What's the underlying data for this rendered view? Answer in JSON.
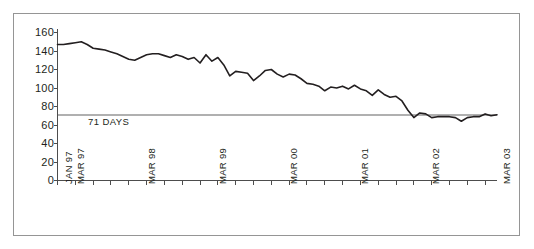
{
  "figure": {
    "background_color": "#ffffff",
    "frame_color": "#959595"
  },
  "chart_data": {
    "type": "line",
    "title": "",
    "subtitle": "",
    "xlabel": "",
    "ylabel": "",
    "ylim": [
      0,
      160
    ],
    "xlim": [
      0,
      74
    ],
    "grid": false,
    "legend": null,
    "line_color": "#231f20",
    "reference_line": {
      "label": "71 DAYS",
      "value": 71,
      "color": "#b0b0b0"
    },
    "ytick_labels": [
      "0",
      "20",
      "40",
      "60",
      "80",
      "100",
      "120",
      "140",
      "160"
    ],
    "ytick_values": [
      0,
      20,
      40,
      60,
      80,
      100,
      120,
      140,
      160
    ],
    "xtick_labels": [
      "JAN 97",
      "MAR 97",
      "MAR 98",
      "MAR 99",
      "MAR 00",
      "MAR 01",
      "MAR 02",
      "MAR 03"
    ],
    "xtick_label_positions": [
      0,
      2,
      14,
      26,
      38,
      50,
      62,
      74
    ],
    "minor_tick_interval_months": 3,
    "x_unit": "month_index_from_jan_1997",
    "x": [
      0,
      1,
      2,
      3,
      4,
      5,
      6,
      7,
      8,
      9,
      10,
      11,
      12,
      13,
      14,
      15,
      16,
      17,
      18,
      19,
      20,
      21,
      22,
      23,
      24,
      25,
      26,
      27,
      28,
      29,
      30,
      31,
      32,
      33,
      34,
      35,
      36,
      37,
      38,
      39,
      40,
      41,
      42,
      43,
      44,
      45,
      46,
      47,
      48,
      49,
      50,
      51,
      52,
      53,
      54,
      55,
      56,
      57,
      58,
      59,
      60,
      61,
      62,
      63,
      64,
      65,
      66,
      67,
      68,
      69,
      70,
      71,
      72,
      73,
      74
    ],
    "values": [
      147,
      147,
      148,
      149,
      150,
      147,
      143,
      142,
      141,
      139,
      137,
      134,
      131,
      130,
      133,
      136,
      137,
      137,
      135,
      133,
      136,
      134,
      131,
      133,
      127,
      136,
      129,
      133,
      125,
      113,
      118,
      117,
      116,
      108,
      113,
      119,
      120,
      115,
      112,
      115,
      114,
      110,
      105,
      104,
      102,
      97,
      101,
      100,
      102,
      99,
      103,
      99,
      97,
      92,
      98,
      93,
      90,
      91,
      86,
      76,
      68,
      73,
      72,
      68,
      69,
      69,
      69,
      68,
      64,
      68,
      69,
      69,
      72,
      70,
      71
    ]
  }
}
